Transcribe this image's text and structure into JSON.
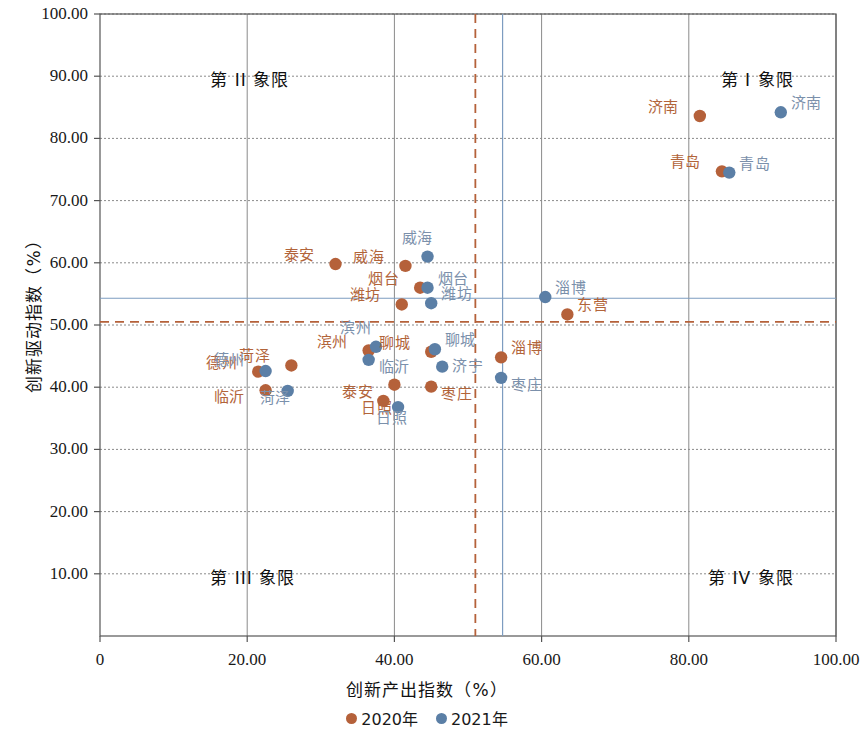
{
  "chart_data": {
    "type": "scatter",
    "title": "",
    "xlabel": "创新产出指数（%）",
    "ylabel": "创新驱动指数（%）",
    "xlim": [
      0,
      100
    ],
    "ylim": [
      0,
      100
    ],
    "xticks": [
      "0",
      "20.00",
      "40.00",
      "60.00",
      "80.00",
      "100.00"
    ],
    "xtick_values": [
      0,
      20,
      40,
      60,
      80,
      100
    ],
    "yticks": [
      "10.00",
      "20.00",
      "30.00",
      "40.00",
      "50.00",
      "60.00",
      "70.00",
      "80.00",
      "90.00",
      "100.00"
    ],
    "ytick_values": [
      10,
      20,
      30,
      40,
      50,
      60,
      70,
      80,
      90,
      100
    ],
    "grid": true,
    "legend_position": "bottom",
    "colors": {
      "series_2020": "#b5613a",
      "series_2021": "#5b7fa6",
      "label_2020": "#b2643a",
      "label_2021": "#7b90ab",
      "grid": "#8a8a8a",
      "axis": "#555555",
      "ref_line_2020": "#b5613a",
      "ref_line_2021": "#7d9cc0"
    },
    "reference_lines": [
      {
        "name": "mean-x-2020",
        "axis": "vertical",
        "value": 51.0,
        "style": "dashed",
        "color": "#b5613a"
      },
      {
        "name": "mean-y-2020",
        "axis": "horizontal",
        "value": 50.5,
        "style": "dashed",
        "color": "#b5613a"
      },
      {
        "name": "mean-x-2021",
        "axis": "vertical",
        "value": 54.7,
        "style": "solid",
        "color": "#7d9cc0"
      },
      {
        "name": "mean-y-2021",
        "axis": "horizontal",
        "value": 54.3,
        "style": "solid",
        "color": "#7d9cc0"
      }
    ],
    "quadrants": [
      {
        "name": "quadrant-1",
        "label": "第 I 象限",
        "x": 82,
        "y": 90
      },
      {
        "name": "quadrant-2",
        "label": "第 II 象限",
        "x": 15,
        "y": 90
      },
      {
        "name": "quadrant-3",
        "label": "第 III 象限",
        "x": 15,
        "y": 10
      },
      {
        "name": "quadrant-4",
        "label": "第 IV 象限",
        "x": 82,
        "y": 10
      }
    ],
    "series": [
      {
        "name": "2020年",
        "legend": "2020年",
        "color": "#b5613a",
        "points": [
          {
            "city": "济南",
            "x": 81.5,
            "y": 83.6,
            "label_dx": -36,
            "label_dy": -8
          },
          {
            "city": "青岛",
            "x": 84.5,
            "y": 74.7,
            "label_dx": -36,
            "label_dy": -8
          },
          {
            "city": "泰安",
            "x": 32.0,
            "y": 59.8,
            "label_dx": -36,
            "label_dy": -8
          },
          {
            "city": "威海",
            "x": 41.5,
            "y": 59.5,
            "label_dx": -36,
            "label_dy": -8
          },
          {
            "city": "烟台",
            "x": 43.5,
            "y": 56.0,
            "label_dx": -36,
            "label_dy": -8
          },
          {
            "city": "潍坊",
            "x": 41.0,
            "y": 53.3,
            "label_dx": -36,
            "label_dy": -8
          },
          {
            "city": "东营",
            "x": 63.5,
            "y": 51.7,
            "label_dx": 10,
            "label_dy": -8
          },
          {
            "city": "淄博",
            "x": 54.5,
            "y": 44.8,
            "label_dx": 10,
            "label_dy": -8
          },
          {
            "city": "聊城",
            "x": 45.0,
            "y": 45.7,
            "label_dx": -36,
            "label_dy": -8
          },
          {
            "city": "滨州",
            "x": 36.5,
            "y": 45.9,
            "label_dx": -36,
            "label_dy": -8
          },
          {
            "city": "菏泽",
            "x": 26.0,
            "y": 43.5,
            "label_dx": -36,
            "label_dy": -8
          },
          {
            "city": "德州",
            "x": 21.5,
            "y": 42.5,
            "label_dx": -36,
            "label_dy": -8
          },
          {
            "city": "泰安",
            "x": 40.0,
            "y": 40.4,
            "label_dx": -36,
            "label_dy": 8
          },
          {
            "city": "枣庄",
            "x": 45.0,
            "y": 40.1,
            "label_dx": 10,
            "label_dy": 8
          },
          {
            "city": "临沂",
            "x": 22.5,
            "y": 39.5,
            "label_dx": -36,
            "label_dy": 8
          },
          {
            "city": "日照",
            "x": 38.5,
            "y": 37.8,
            "label_dx": -6,
            "label_dy": 8
          }
        ]
      },
      {
        "name": "2021年",
        "legend": "2021年",
        "color": "#5b7fa6",
        "points": [
          {
            "city": "济南",
            "x": 92.5,
            "y": 84.2,
            "label_dx": 10,
            "label_dy": -8
          },
          {
            "city": "青岛",
            "x": 85.5,
            "y": 74.5,
            "label_dx": 10,
            "label_dy": -8
          },
          {
            "city": "威海",
            "x": 44.5,
            "y": 61.0,
            "label_dx": -10,
            "label_dy": -18
          },
          {
            "city": "烟台",
            "x": 44.5,
            "y": 56.0,
            "label_dx": 10,
            "label_dy": -8
          },
          {
            "city": "潍坊",
            "x": 45.0,
            "y": 53.5,
            "label_dx": 10,
            "label_dy": -8
          },
          {
            "city": "淄博",
            "x": 60.5,
            "y": 54.5,
            "label_dx": 10,
            "label_dy": -8
          },
          {
            "city": "聊城",
            "x": 45.5,
            "y": 46.1,
            "label_dx": 10,
            "label_dy": -8
          },
          {
            "city": "滨州",
            "x": 37.5,
            "y": 46.5,
            "label_dx": -20,
            "label_dy": -18
          },
          {
            "city": "济宁",
            "x": 46.5,
            "y": 43.3,
            "label_dx": 10,
            "label_dy": 0
          },
          {
            "city": "临沂",
            "x": 36.5,
            "y": 44.4,
            "label_dx": 10,
            "label_dy": 8
          },
          {
            "city": "德州",
            "x": 22.5,
            "y": 42.6,
            "label_dx": -36,
            "label_dy": -10
          },
          {
            "city": "枣庄",
            "x": 54.5,
            "y": 41.5,
            "label_dx": 10,
            "label_dy": 8
          },
          {
            "city": "菏泽",
            "x": 25.5,
            "y": 39.4,
            "label_dx": -12,
            "label_dy": 8
          },
          {
            "city": "日照",
            "x": 40.5,
            "y": 36.8,
            "label_dx": -6,
            "label_dy": 12
          }
        ]
      }
    ]
  }
}
